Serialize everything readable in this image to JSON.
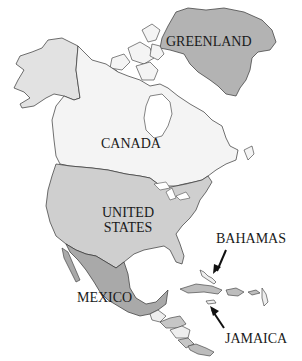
{
  "map": {
    "title": "North America",
    "colors": {
      "background": "#ffffff",
      "canada": "#f4f4f4",
      "alaska": "#e2e2e2",
      "united_states": "#cfcfcf",
      "greenland": "#b3b3b3",
      "mexico": "#a9a9a9",
      "central_america_light": "#eeeeee",
      "central_america_mid": "#c6c6c6",
      "caribbean": "#bdbdbd",
      "outline": "#333333"
    },
    "labels": {
      "greenland": "GREENLAND",
      "canada": "CANADA",
      "united_states_line1": "UNITED",
      "united_states_line2": "STATES",
      "bahamas": "BAHAMAS",
      "mexico": "MEXICO",
      "jamaica": "JAMAICA"
    }
  }
}
